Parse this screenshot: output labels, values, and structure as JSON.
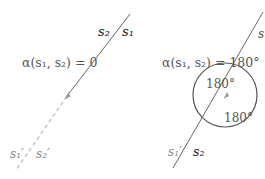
{
  "panels": [
    {
      "id": "left",
      "equation": "α(s₁, s₂) = 0",
      "labels": {
        "top_a": "s₂",
        "top_b": "s₁",
        "bottom_a": "s₁′",
        "bottom_b": "s₂′"
      },
      "line": {
        "solid_from": [
          130,
          14
        ],
        "solid_to": [
          67,
          96
        ],
        "dashed_to": [
          16,
          170
        ]
      }
    },
    {
      "id": "right",
      "equation": "α(s₁, s₂) = 180°",
      "labels": {
        "top": "s₁",
        "bottom_a": "s₁′",
        "bottom_b": "s₂",
        "angle_upper": "180°",
        "angle_lower": "180°"
      },
      "line": {
        "from": [
          263,
          12
        ],
        "to": [
          173,
          168
        ]
      },
      "circle": {
        "cx": 225,
        "cy": 95,
        "r": 32
      }
    }
  ],
  "colors": {
    "line": "#666666",
    "dashed": "#bdbdbd",
    "circle": "#555555",
    "text": "#555555"
  }
}
